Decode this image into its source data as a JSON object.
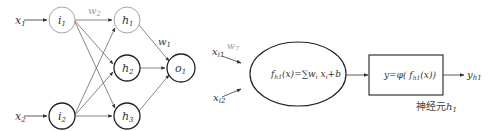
{
  "left_network": {
    "inputs": [
      {
        "id": "x1",
        "base": "x",
        "sub": "1"
      },
      {
        "id": "x2",
        "base": "x",
        "sub": "2"
      }
    ],
    "input_nodes": [
      {
        "id": "i1",
        "base": "i",
        "sub": "1",
        "highlight": false
      },
      {
        "id": "i2",
        "base": "i",
        "sub": "2",
        "highlight": true
      }
    ],
    "hidden_nodes": [
      {
        "id": "h1",
        "base": "h",
        "sub": "1",
        "highlight": false
      },
      {
        "id": "h2",
        "base": "h",
        "sub": "2",
        "highlight": true
      },
      {
        "id": "h3",
        "base": "h",
        "sub": "3",
        "highlight": true
      }
    ],
    "output_nodes": [
      {
        "id": "o1",
        "base": "o",
        "sub": "1",
        "highlight": true
      }
    ],
    "weight_labels": {
      "w2": {
        "base": "w",
        "sub": "2",
        "color": "#9a9a9a"
      },
      "w1": {
        "base": "w",
        "sub": "1",
        "color": "#333333"
      }
    }
  },
  "right_neuron": {
    "inputs": [
      {
        "base": "x",
        "sub": "i1"
      },
      {
        "base": "x",
        "sub": "i2"
      }
    ],
    "input_weight": {
      "base": "w",
      "sub": "7",
      "color": "#9a9a9a"
    },
    "sum_formula": "f_h1(x)=∑w_i x_i+b",
    "sum_formula_parts": {
      "f": "f",
      "f_sub": "h1",
      "rest1": "(x)=∑w",
      "w_sub": "i",
      "x": " x",
      "x_sub": "i",
      "rest2": "+b"
    },
    "activation_formula": "y=φ( f_h1(x))",
    "activation_parts": {
      "pre": "y=φ( f",
      "sub": "h1",
      "post": "(x))"
    },
    "output": {
      "base": "y",
      "sub": "h1"
    },
    "caption": {
      "text": "神经元",
      "base": "h",
      "sub": "1"
    }
  },
  "colors": {
    "stroke": "#333333",
    "highlight_stroke": "#222222",
    "muted_stroke": "#9a9a9a"
  }
}
